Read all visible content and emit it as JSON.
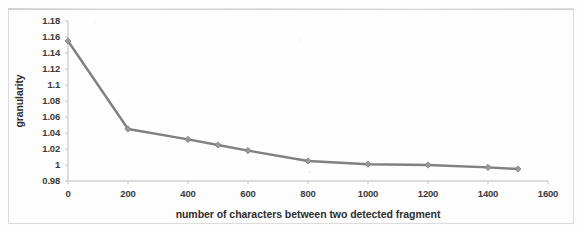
{
  "chart_data": {
    "type": "line",
    "title": "",
    "xlabel": "number of characters between two detected fragment",
    "ylabel": "granularity",
    "xlim": [
      0,
      1600
    ],
    "ylim": [
      0.98,
      1.18
    ],
    "xticks": [
      0,
      200,
      400,
      600,
      800,
      1000,
      1200,
      1400,
      1600
    ],
    "xtick_labels": [
      "0",
      "200",
      "400",
      "600",
      "800",
      "1000",
      "1200",
      "1400",
      "1600"
    ],
    "yticks": [
      0.98,
      1,
      1.02,
      1.04,
      1.06,
      1.08,
      1.1,
      1.12,
      1.14,
      1.16,
      1.18
    ],
    "ytick_labels": [
      "0.98",
      "1",
      "1.02",
      "1.04",
      "1.06",
      "1.08",
      "1.1",
      "1.12",
      "1.14",
      "1.16",
      "1.18"
    ],
    "grid": false,
    "legend": null,
    "legend_position": "none",
    "marker": "diamond",
    "line_color": "#808080",
    "marker_color": "#9a9a9a",
    "axis_color": "#b8b8b8",
    "x": [
      0,
      200,
      400,
      500,
      600,
      800,
      1000,
      1200,
      1400,
      1500
    ],
    "values": [
      1.155,
      1.045,
      1.032,
      1.025,
      1.018,
      1.005,
      1.001,
      1.0,
      0.997,
      0.995
    ],
    "series": [
      {
        "name": "granularity",
        "points": [
          {
            "x": 0,
            "y": 1.155
          },
          {
            "x": 200,
            "y": 1.045
          },
          {
            "x": 400,
            "y": 1.032
          },
          {
            "x": 500,
            "y": 1.025
          },
          {
            "x": 600,
            "y": 1.018
          },
          {
            "x": 800,
            "y": 1.005
          },
          {
            "x": 1000,
            "y": 1.001
          },
          {
            "x": 1200,
            "y": 1.0
          },
          {
            "x": 1400,
            "y": 0.997
          },
          {
            "x": 1500,
            "y": 0.995
          }
        ]
      }
    ]
  }
}
